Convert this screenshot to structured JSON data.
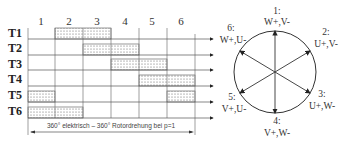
{
  "diagram": {
    "columns": [
      "1",
      "2",
      "3",
      "4",
      "5",
      "6"
    ],
    "rows": [
      {
        "label": "T1",
        "on": [
          2,
          3
        ]
      },
      {
        "label": "T2",
        "on": [
          3,
          4
        ]
      },
      {
        "label": "T3",
        "on": [
          4,
          5
        ]
      },
      {
        "label": "T4",
        "on": [
          5,
          6
        ]
      },
      {
        "label": "T5",
        "on": [
          1,
          6
        ]
      },
      {
        "label": "T6",
        "on": [
          1,
          2
        ]
      }
    ],
    "caption": "360° elektrisch – 360° Rotordrehung bei p=1",
    "vectors": [
      {
        "num": "1:",
        "text": "W+,V-"
      },
      {
        "num": "2:",
        "text": "U+,V-"
      },
      {
        "num": "3:",
        "text": "U+,W-"
      },
      {
        "num": "4:",
        "text": "V+,W-"
      },
      {
        "num": "5:",
        "text": "V+,U-"
      },
      {
        "num": "6:",
        "text": "W+,U-"
      }
    ]
  },
  "colors": {
    "line": "#555555",
    "fill_pattern_dot": "#333333",
    "text": "#222222"
  }
}
